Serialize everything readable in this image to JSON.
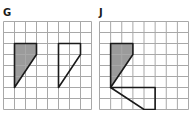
{
  "panels": [
    {
      "id": "G",
      "label": "G",
      "grid": {
        "cols": 8,
        "rows": 8
      },
      "shaded_shape": [
        [
          1,
          2
        ],
        [
          3,
          2
        ],
        [
          3,
          3
        ],
        [
          1,
          6
        ]
      ],
      "outline_shape": [
        [
          5,
          2
        ],
        [
          7,
          2
        ],
        [
          7,
          3
        ],
        [
          5,
          6
        ]
      ]
    },
    {
      "id": "J",
      "label": "J",
      "grid": {
        "cols": 8,
        "rows": 8
      },
      "shaded_shape": [
        [
          1,
          2
        ],
        [
          3,
          2
        ],
        [
          3,
          3
        ],
        [
          1,
          6
        ]
      ],
      "outline_shape": [
        [
          1,
          6
        ],
        [
          5,
          6
        ],
        [
          5,
          8
        ],
        [
          4,
          8
        ]
      ]
    }
  ],
  "colors": {
    "grid_line": "#a8a8a8",
    "shaded_fill": "#9b9b9b",
    "outline": "#1a1a1a"
  }
}
